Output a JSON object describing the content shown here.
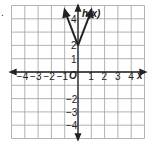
{
  "problem_marker": ".",
  "chart_data": {
    "type": "line",
    "title": "",
    "function_label": "h(x)",
    "xlabel": "x",
    "ylabel": "h(x)",
    "origin_label": "O",
    "xlim": [
      -5,
      5
    ],
    "ylim": [
      -5,
      5
    ],
    "grid": true,
    "x_ticks": [
      "-4",
      "-3",
      "-2",
      "-1",
      "1",
      "2",
      "3",
      "4"
    ],
    "y_ticks": [
      "4",
      "2",
      "1",
      "-2",
      "-3",
      "-4"
    ],
    "series": [
      {
        "name": "h(x)",
        "shape": "absolute value V",
        "vertex": [
          0,
          2
        ],
        "points": [
          [
            -1,
            4.6
          ],
          [
            0,
            2
          ],
          [
            1,
            4.6
          ]
        ],
        "arrows": "both ends"
      }
    ],
    "colors": {
      "grid": "#9a9a9a",
      "axis": "#222222",
      "curve": "#222222"
    }
  }
}
